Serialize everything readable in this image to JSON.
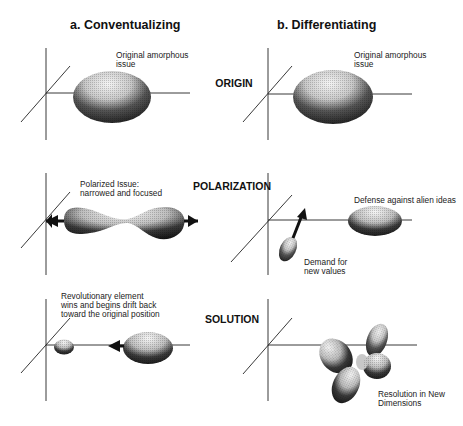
{
  "columns": [
    {
      "id": "a",
      "title": "a.  Conventualizing"
    },
    {
      "id": "b",
      "title": "b.  Differentiating"
    }
  ],
  "rows": [
    {
      "id": "origin",
      "label": "ORIGIN"
    },
    {
      "id": "polarization",
      "label": "POLARIZATION"
    },
    {
      "id": "solution",
      "label": "SOLUTION"
    }
  ],
  "annotations": {
    "a_origin": [
      "Original amorphous",
      "issue"
    ],
    "b_origin": [
      "Original amorphous",
      "issue"
    ],
    "a_polarization": [
      "Polarized Issue:",
      "narrowed and focused"
    ],
    "b_polarization_defense": [
      "Defense against alien ideas"
    ],
    "b_polarization_demand": [
      "Demand for",
      "new values"
    ],
    "a_solution": [
      "Revolutionary element",
      "wins and begins drift back",
      "toward the original position"
    ],
    "b_solution": [
      "Resolution in  New",
      "Dimensions"
    ]
  },
  "colors": {
    "ink": "#111111",
    "shade_dark": "#1a1a1a",
    "shade_light": "#e8e8e8"
  }
}
